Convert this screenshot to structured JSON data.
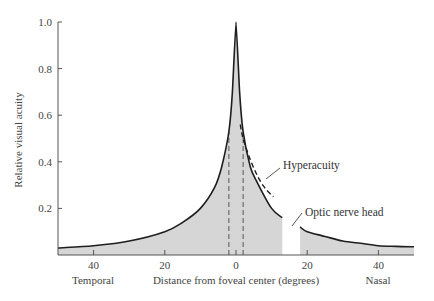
{
  "chart_data": {
    "type": "area",
    "title": "",
    "xlabel": "Distance from foveal center (degrees)",
    "ylabel": "Relative visual acuity",
    "x_side_labels": {
      "left": "Temporal",
      "right": "Nasal"
    },
    "xlim": [
      -50,
      50
    ],
    "ylim": [
      0,
      1.0
    ],
    "x_ticks": [
      {
        "value": -40,
        "label": "40"
      },
      {
        "value": -20,
        "label": "20"
      },
      {
        "value": 0,
        "label": "0"
      },
      {
        "value": 20,
        "label": "20"
      },
      {
        "value": 40,
        "label": "40"
      }
    ],
    "y_ticks": [
      {
        "value": 0.2,
        "label": "0.2"
      },
      {
        "value": 0.4,
        "label": "0.4"
      },
      {
        "value": 0.6,
        "label": "0.6"
      },
      {
        "value": 0.8,
        "label": "0.8"
      },
      {
        "value": 1.0,
        "label": "1.0"
      }
    ],
    "grid": false,
    "series": [
      {
        "name": "Visual acuity (temporal to fovea to blind spot)",
        "style": "solid-filled",
        "x": [
          -50,
          -40,
          -30,
          -20,
          -15,
          -10,
          -6,
          -4,
          -2,
          -1,
          0,
          1,
          2,
          4,
          6,
          10,
          13
        ],
        "y": [
          0.03,
          0.04,
          0.06,
          0.1,
          0.14,
          0.2,
          0.29,
          0.38,
          0.53,
          0.7,
          1.0,
          0.7,
          0.53,
          0.38,
          0.31,
          0.2,
          0.16
        ]
      },
      {
        "name": "Visual acuity (nasal beyond blind spot)",
        "style": "solid-filled",
        "x": [
          18,
          20,
          25,
          30,
          35,
          40,
          45,
          50
        ],
        "y": [
          0.12,
          0.1,
          0.08,
          0.06,
          0.05,
          0.04,
          0.037,
          0.035
        ]
      },
      {
        "name": "Hyperacuity",
        "style": "dashed",
        "x": [
          1.2,
          2,
          4,
          6,
          8,
          10.5
        ],
        "y": [
          0.56,
          0.5,
          0.41,
          0.34,
          0.29,
          0.25
        ]
      }
    ],
    "reference_lines": [
      {
        "type": "vertical-dashed",
        "x": -2,
        "from": 0,
        "to": 0.53
      },
      {
        "type": "vertical-dashed",
        "x": 2,
        "from": 0,
        "to": 0.53
      }
    ],
    "gaps": [
      {
        "name": "Optic nerve head",
        "x_range": [
          13,
          18
        ]
      }
    ],
    "annotations": [
      {
        "text": "Hyperacuity",
        "points_to": {
          "x": 8.5,
          "y": 0.29
        }
      },
      {
        "text": "Optic nerve head",
        "points_to": {
          "x": 15,
          "y": 0.1
        }
      }
    ],
    "fill_color": "#d6d6d6",
    "line_color": "#1e1e1e"
  }
}
